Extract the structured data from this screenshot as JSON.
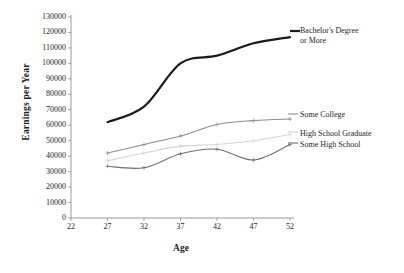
{
  "chart_data": {
    "type": "line",
    "title": "",
    "xlabel": "Age",
    "ylabel": "Earnings per Year",
    "x": [
      27,
      32,
      37,
      42,
      47,
      52
    ],
    "xlim": [
      22,
      52
    ],
    "ylim": [
      0,
      130000
    ],
    "xticks": [
      "22",
      "27",
      "32",
      "37",
      "42",
      "47",
      "52"
    ],
    "yticks": [
      "130000",
      "120000",
      "110000",
      "100000",
      "90000",
      "80000",
      "70000",
      "60000",
      "50000",
      "40000",
      "30000",
      "20000",
      "10000",
      "0"
    ],
    "grid": false,
    "legend_position": "right-inline-annotations",
    "series": [
      {
        "name": "Bachelor's Degree or More",
        "label_line1": "Bachelor's Degree",
        "label_line2": "or More",
        "color": "#1a1a1a",
        "width": 2.2,
        "markers": false,
        "values": [
          62000,
          72000,
          100000,
          105000,
          113000,
          117000
        ]
      },
      {
        "name": "Some College",
        "label_line1": "Some College",
        "label_line2": "",
        "color": "#8d8d8f",
        "width": 1.1,
        "markers": true,
        "values": [
          42000,
          47500,
          53000,
          60500,
          63000,
          64000
        ]
      },
      {
        "name": "High School Graduate",
        "label_line1": "High School Graduate",
        "label_line2": "",
        "color": "#d4d4d6",
        "width": 1.1,
        "markers": true,
        "values": [
          37000,
          42000,
          46500,
          47500,
          50000,
          54000
        ]
      },
      {
        "name": "Some High School",
        "label_line1": "Some High School",
        "label_line2": "",
        "color": "#6e6e70",
        "width": 1.1,
        "markers": true,
        "values": [
          33500,
          32500,
          41500,
          44500,
          37500,
          47500
        ]
      }
    ]
  },
  "caption": {
    "text": ""
  }
}
